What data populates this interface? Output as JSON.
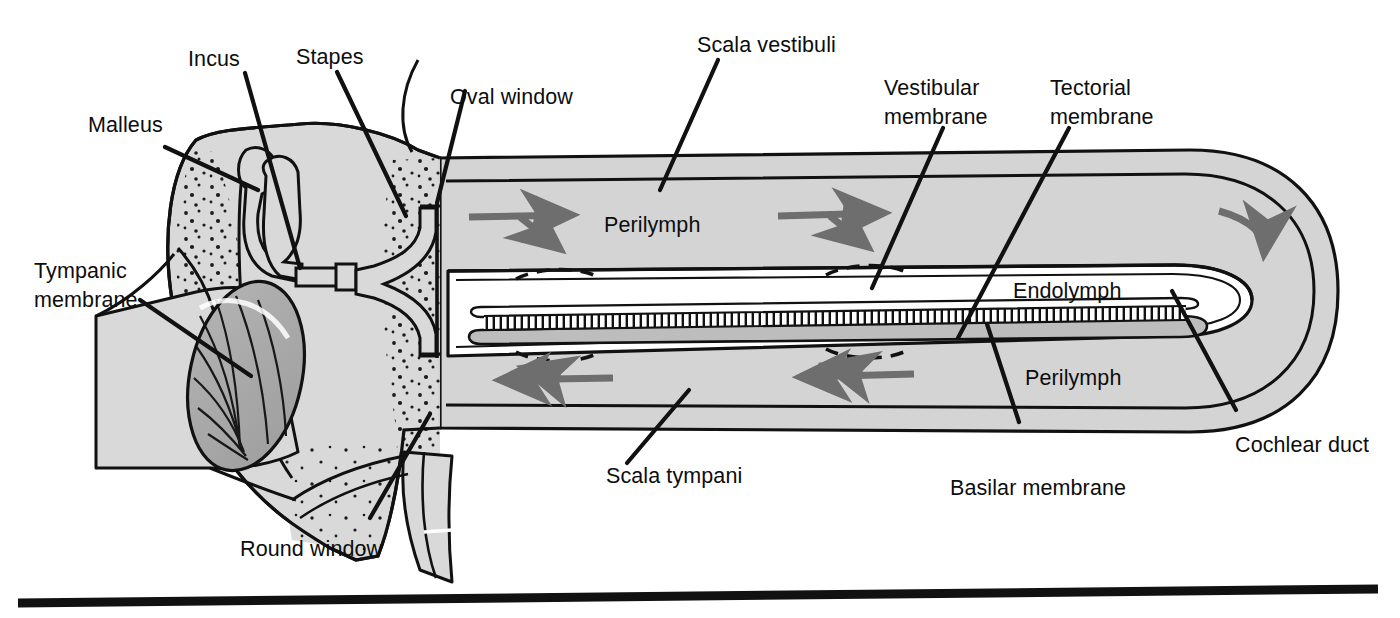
{
  "figure": {
    "background_color": "#ffffff",
    "ink_color": "#111111",
    "bone_fill": "#d9d9d9",
    "perilymph_fill": "#d4d4d4",
    "endolymph_fill": "#ffffff",
    "tympanic_membrane_fill": "#a9a9a9",
    "basilar_membrane_fill": "#c0c0c0",
    "arrow_color": "#6e6e6e"
  },
  "labels": {
    "malleus": "Malleus",
    "incus": "Incus",
    "stapes": "Stapes",
    "oval_window": "Oval window",
    "scala_vestibuli": "Scala vestibuli",
    "vestibular_membrane_line1": "Vestibular",
    "vestibular_membrane_line2": "membrane",
    "tectorial_membrane_line1": "Tectorial",
    "tectorial_membrane_line2": "membrane",
    "tympanic_membrane_line1": "Tympanic",
    "tympanic_membrane_line2": "membrane",
    "perilymph_upper": "Perilymph",
    "perilymph_lower": "Perilymph",
    "endolymph": "Endolymph",
    "cochlear_duct": "Cochlear duct",
    "basilar_membrane": "Basilar membrane",
    "scala_tympani": "Scala tympani",
    "round_window": "Round window"
  },
  "flow_arrows": [
    {
      "name": "scala-vestibuli-arrow-1",
      "direction": "right-with-down-branch",
      "region": "scala vestibuli"
    },
    {
      "name": "scala-vestibuli-arrow-2",
      "direction": "right-with-down-branch",
      "region": "scala vestibuli"
    },
    {
      "name": "helicotrema-arrow",
      "direction": "curved-down",
      "region": "apex"
    },
    {
      "name": "scala-tympani-arrow-1",
      "direction": "left-with-up-branch",
      "region": "scala tympani"
    },
    {
      "name": "scala-tympani-arrow-2",
      "direction": "left-with-up-branch",
      "region": "scala tympani"
    }
  ],
  "footer_rule": {
    "name": "bottom-rule",
    "visible": true
  }
}
